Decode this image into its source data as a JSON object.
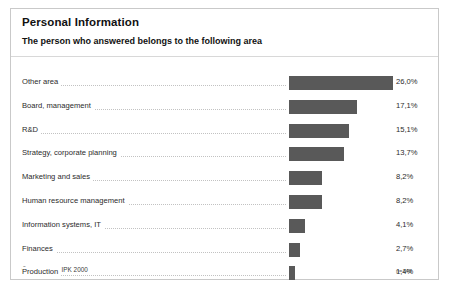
{
  "slide": {
    "title": "Personal Information",
    "subtitle": "The person who answered belongs to the following area",
    "copyright": "© Fraunhofer IPK 2000",
    "sample_note": "n=146",
    "bar_color": "#595959",
    "border_color": "#c9c9c9",
    "background": "#ffffff"
  },
  "chart_data": {
    "type": "bar",
    "orientation": "horizontal",
    "title": "Personal Information",
    "subtitle": "The person who answered belongs to the following area",
    "xlabel": "",
    "ylabel": "",
    "xlim": [
      0,
      26
    ],
    "grid": false,
    "legend": "none",
    "value_suffix": "%",
    "decimal_separator": ",",
    "sample_size": "n=146",
    "categories": [
      "Other area",
      "Board, management",
      "R&D",
      "Strategy, corporate planning",
      "Marketing and sales",
      "Human resource management",
      "Information systems, IT",
      "Finances",
      "Production"
    ],
    "values": [
      26.0,
      17.1,
      15.1,
      13.7,
      8.2,
      8.2,
      4.1,
      2.7,
      1.4
    ],
    "value_labels": [
      "26,0%",
      "17,1%",
      "15,1%",
      "13,7%",
      "8,2%",
      "8,2%",
      "4,1%",
      "2,7%",
      "1,4%"
    ]
  }
}
